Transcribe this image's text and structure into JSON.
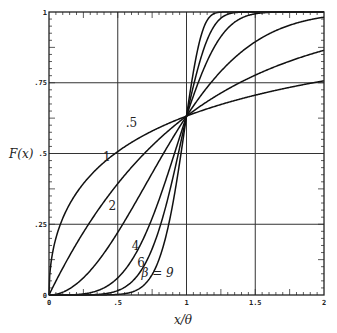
{
  "chart_data": {
    "type": "line",
    "title": "",
    "xlabel": "x/θ",
    "ylabel": "F(x)",
    "xlim": [
      0,
      2
    ],
    "ylim": [
      0,
      1
    ],
    "grid": true,
    "x_ticks": [
      {
        "value": 0,
        "label": "0"
      },
      {
        "value": 0.5,
        "label": ".5"
      },
      {
        "value": 1,
        "label": "1"
      },
      {
        "value": 1.5,
        "label": "1.5"
      },
      {
        "value": 2,
        "label": "2"
      }
    ],
    "y_ticks": [
      {
        "value": 0,
        "label": "0"
      },
      {
        "value": 0.25,
        "label": ".25"
      },
      {
        "value": 0.5,
        "label": ".5"
      },
      {
        "value": 0.75,
        "label": ".75"
      },
      {
        "value": 1,
        "label": "1"
      }
    ],
    "function": "F(x) = 1 - exp(-(x/θ)^β)",
    "x": [
      0,
      0.25,
      0.5,
      0.75,
      1.0,
      1.25,
      1.5,
      1.75,
      2.0
    ],
    "series": [
      {
        "name": ".5",
        "beta": 0.5,
        "values": [
          0,
          0.393,
          0.507,
          0.579,
          0.632,
          0.673,
          0.706,
          0.733,
          0.757
        ],
        "label": ".5",
        "label_pos": [
          0.6,
          0.595
        ]
      },
      {
        "name": "1",
        "beta": 1,
        "values": [
          0,
          0.221,
          0.393,
          0.528,
          0.632,
          0.713,
          0.777,
          0.826,
          0.865
        ],
        "label": "1",
        "label_pos": [
          0.42,
          0.475
        ]
      },
      {
        "name": "2",
        "beta": 2,
        "values": [
          0,
          0.061,
          0.221,
          0.43,
          0.632,
          0.79,
          0.895,
          0.953,
          0.982
        ],
        "label": "2",
        "label_pos": [
          0.46,
          0.3
        ]
      },
      {
        "name": "4",
        "beta": 4,
        "values": [
          0,
          0.004,
          0.061,
          0.271,
          0.632,
          0.912,
          0.994,
          1.0,
          1.0
        ],
        "label": "4",
        "label_pos": [
          0.63,
          0.16
        ]
      },
      {
        "name": "6",
        "beta": 6,
        "values": [
          0,
          0.0002,
          0.016,
          0.163,
          0.632,
          0.977,
          1.0,
          1.0,
          1.0
        ],
        "label": "6",
        "label_pos": [
          0.67,
          0.1
        ]
      },
      {
        "name": "9",
        "beta": 9,
        "values": [
          0,
          0.0,
          0.002,
          0.073,
          0.632,
          0.999,
          1.0,
          1.0,
          1.0
        ],
        "label": "β = 9",
        "label_pos": [
          0.79,
          0.065
        ]
      }
    ]
  },
  "labels": {
    "ylabel_text": "F(x)",
    "xlabel_text": "x/θ"
  }
}
